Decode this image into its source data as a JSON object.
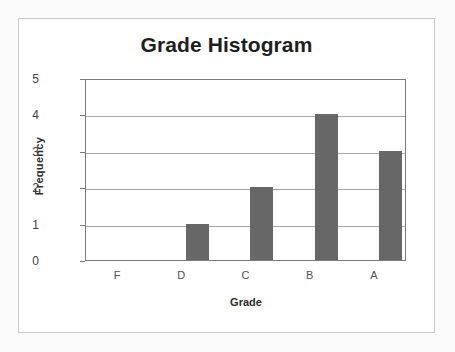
{
  "chart_data": {
    "type": "bar",
    "title": "Grade Histogram",
    "xlabel": "Grade",
    "ylabel": "Frequency",
    "categories": [
      "F",
      "D",
      "C",
      "B",
      "A"
    ],
    "values": [
      0,
      1,
      2,
      4,
      3
    ],
    "ylim": [
      0,
      5
    ],
    "yticks": [
      "0",
      "1",
      "2",
      "3",
      "4",
      "5"
    ],
    "grid": true,
    "legend": false,
    "bar_color": "#676767",
    "plot_border_color": "#7d7d7d",
    "gridline_color": "#a6a6a6",
    "background_color": "#ffffff",
    "frame_border_color": "#c9c9c9",
    "page_background_color": "#fbfbfb"
  }
}
